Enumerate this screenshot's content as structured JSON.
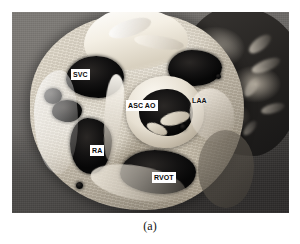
{
  "figure": {
    "caption": "(a)",
    "type": "anatomical-photograph",
    "modality": "grayscale-photograph",
    "background_color": "#6d6d6d",
    "specimen_color": "#ded7c8",
    "cavity_color": "#0d0d0d",
    "label_box_color": "#ffffff",
    "label_text_color": "#0a0a0a"
  },
  "labels": [
    {
      "id": "svc",
      "text": "SVC",
      "meaning": "superior vena cava",
      "boxed": true
    },
    {
      "id": "asc-ao",
      "text": "ASC AO",
      "meaning": "ascending aorta",
      "boxed": true
    },
    {
      "id": "laa",
      "text": "LAA",
      "meaning": "left atrial appendage",
      "boxed": false
    },
    {
      "id": "ra",
      "text": "RA",
      "meaning": "right atrium",
      "boxed": true
    },
    {
      "id": "rvot",
      "text": "RVOT",
      "meaning": "right ventricular outflow tract",
      "boxed": true
    }
  ]
}
